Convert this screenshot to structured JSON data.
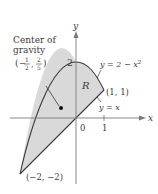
{
  "figure": {
    "type": "region-centroid-diagram",
    "axes": {
      "x_label": "x",
      "y_label": "y",
      "origin_label": "0",
      "x_tick_label": "1",
      "y_tick_label": "2"
    },
    "curves": [
      {
        "label": "y = 2 − x²",
        "label_main": "y = 2 − x",
        "label_sup": "2"
      },
      {
        "label": "y = x"
      }
    ],
    "region_label": "R",
    "points": [
      {
        "label": "(1, 1)",
        "x": 1,
        "y": 1
      },
      {
        "label": "(−2, −2)",
        "x": -2,
        "y": -2
      }
    ],
    "centroid": {
      "title_line1": "Center of",
      "title_line2": "gravity",
      "x_num": "1",
      "x_den": "2",
      "x_sign": "−",
      "y_num": "2",
      "y_den": "5",
      "x": -0.5,
      "y": 0.4
    },
    "colors": {
      "region_fill": "#d9d9d9",
      "curve": "#3a3a3a",
      "axis": "#7a7a7a"
    }
  }
}
